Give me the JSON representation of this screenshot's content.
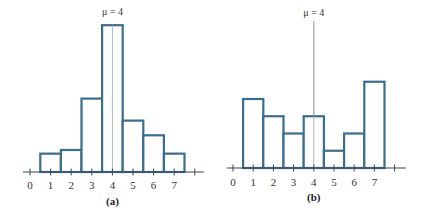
{
  "chart_data": [
    {
      "type": "bar",
      "panel_label": "(a)",
      "annotation": "μ = 4",
      "mean": 4,
      "x_ticks": [
        "0",
        "1",
        "2",
        "3",
        "4",
        "5",
        "6",
        "7"
      ],
      "categories": [
        1,
        2,
        3,
        4,
        5,
        6,
        7
      ],
      "values": [
        0.05,
        0.06,
        0.2,
        0.4,
        0.14,
        0.1,
        0.05
      ],
      "xlabel": "",
      "ylabel": "",
      "ylim": [
        0,
        0.4
      ],
      "grid": false,
      "legend": null
    },
    {
      "type": "bar",
      "panel_label": "(b)",
      "annotation": "μ = 4",
      "mean": 4,
      "x_ticks": [
        "0",
        "1",
        "2",
        "3",
        "4",
        "5",
        "6",
        "7"
      ],
      "categories": [
        1,
        2,
        3,
        4,
        5,
        6,
        7
      ],
      "values": [
        0.2,
        0.15,
        0.1,
        0.15,
        0.05,
        0.1,
        0.25
      ],
      "xlabel": "",
      "ylabel": "",
      "ylim": [
        0,
        0.4
      ],
      "grid": false,
      "legend": null
    }
  ],
  "panels": {
    "a": {
      "label": "(a)",
      "mu_label": "μ = 4",
      "ticks": [
        "0",
        "1",
        "2",
        "3",
        "4",
        "5",
        "6",
        "7"
      ]
    },
    "b": {
      "label": "(b)",
      "mu_label": "μ = 4",
      "ticks": [
        "0",
        "1",
        "2",
        "3",
        "4",
        "5",
        "6",
        "7"
      ]
    }
  }
}
